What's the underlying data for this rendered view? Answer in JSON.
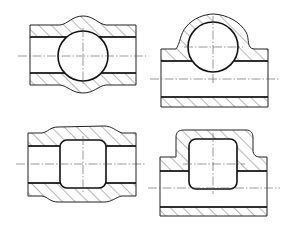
{
  "drawing": {
    "type": "engineering cross-section sheet",
    "colors": {
      "line": "#222222",
      "background": "#ffffff"
    },
    "figures": [
      {
        "id": "fig-1",
        "position": "top-left",
        "description": "Pipe section with symmetric bulge and spherical (circular) cavity"
      },
      {
        "id": "fig-2",
        "position": "top-right",
        "description": "Pipe section with one-sided dome and circular cavity"
      },
      {
        "id": "fig-3",
        "position": "bottom-left",
        "description": "Pipe section with symmetric bulge and rounded-square cavity"
      },
      {
        "id": "fig-4",
        "position": "bottom-right",
        "description": "Pipe section with one-sided boss and rounded-square cavity"
      }
    ]
  }
}
